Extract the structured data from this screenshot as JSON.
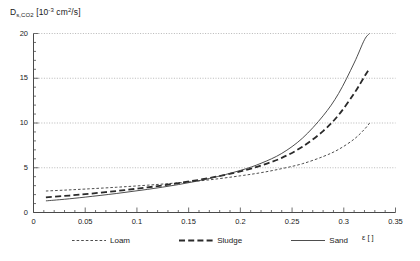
{
  "chart_data": {
    "type": "line",
    "title": "",
    "ylabel": "D_s,CO2 [10^-3 cm^2/s]",
    "ylabel_parts": {
      "symbol": "D",
      "subscript": "s,CO2",
      "units_pre": " [10",
      "units_exp": "-3",
      "units_mid": " cm",
      "units_exp2": "2",
      "units_post": "/s]"
    },
    "xlabel": "ε [ ]",
    "xlabel_symbol": "ε",
    "xlabel_units": "[ ]",
    "xlim": [
      0,
      0.35
    ],
    "ylim": [
      0,
      20
    ],
    "xticks": [
      "0",
      "0.05",
      "0.1",
      "0.15",
      "0.2",
      "0.25",
      "0.3",
      "0.35"
    ],
    "xtick_values": [
      0,
      0.05,
      0.1,
      0.15,
      0.2,
      0.25,
      0.3,
      0.35
    ],
    "yticks": [
      "0",
      "5",
      "10",
      "15",
      "20"
    ],
    "ytick_values": [
      0,
      5,
      10,
      15,
      20
    ],
    "x_minor_step": 0.01,
    "y_minor_step": 1,
    "grid": "horizontal-dotted",
    "legend_position": "below-axes",
    "series": [
      {
        "name": "Loam",
        "style": "dotted",
        "color": "#3a3a3a",
        "x": [
          0.012,
          0.03,
          0.05,
          0.08,
          0.11,
          0.14,
          0.17,
          0.2,
          0.22,
          0.24,
          0.26,
          0.28,
          0.295,
          0.31,
          0.32,
          0.325
        ],
        "y": [
          2.4,
          2.5,
          2.62,
          2.82,
          3.05,
          3.32,
          3.65,
          4.1,
          4.45,
          4.9,
          5.45,
          6.25,
          7.05,
          8.2,
          9.3,
          10.0
        ]
      },
      {
        "name": "Sludge",
        "style": "dashed",
        "color": "#2a2a2a",
        "x": [
          0.012,
          0.03,
          0.05,
          0.08,
          0.11,
          0.14,
          0.17,
          0.2,
          0.22,
          0.24,
          0.26,
          0.28,
          0.295,
          0.31,
          0.32,
          0.325
        ],
        "y": [
          1.7,
          1.85,
          2.05,
          2.4,
          2.8,
          3.28,
          3.85,
          4.6,
          5.25,
          6.1,
          7.35,
          9.1,
          10.9,
          13.3,
          15.2,
          16.1
        ]
      },
      {
        "name": "Sand",
        "style": "solid",
        "color": "#3a3a3a",
        "x": [
          0.012,
          0.03,
          0.05,
          0.08,
          0.11,
          0.14,
          0.17,
          0.2,
          0.22,
          0.24,
          0.26,
          0.28,
          0.295,
          0.31,
          0.32,
          0.325
        ],
        "y": [
          1.3,
          1.48,
          1.72,
          2.12,
          2.58,
          3.12,
          3.8,
          4.7,
          5.5,
          6.6,
          8.3,
          10.8,
          13.3,
          16.7,
          19.3,
          20.0
        ]
      }
    ]
  },
  "legend": {
    "items": [
      {
        "label": "Loam"
      },
      {
        "label": "Sludge"
      },
      {
        "label": "Sand"
      }
    ]
  }
}
